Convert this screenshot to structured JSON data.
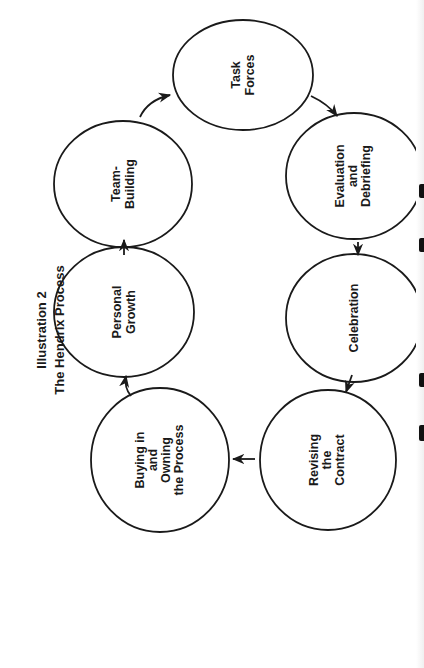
{
  "title": {
    "line1": "Illustration 2",
    "line2": "The Hendrix Process"
  },
  "colors": {
    "stroke": "#1a1a1a",
    "background": "#ffffff"
  },
  "nodes": [
    {
      "id": "task-forces",
      "lines": [
        "Task",
        "Forces"
      ]
    },
    {
      "id": "evaluation",
      "lines": [
        "Evaluation",
        "and",
        "Debriefing"
      ]
    },
    {
      "id": "celebration",
      "lines": [
        "Celebration"
      ]
    },
    {
      "id": "revising",
      "lines": [
        "Revising",
        "the",
        "Contract"
      ]
    },
    {
      "id": "buying-in",
      "lines": [
        "Buying in",
        "and",
        "Owning",
        "the Process"
      ]
    },
    {
      "id": "personal-growth",
      "lines": [
        "Personal",
        "Growth"
      ]
    },
    {
      "id": "team-building",
      "lines": [
        "Team-",
        "Building"
      ]
    }
  ],
  "edges": [
    {
      "from": "Task Forces",
      "to": "Evaluation and Debriefing"
    },
    {
      "from": "Evaluation and Debriefing",
      "to": "Celebration"
    },
    {
      "from": "Celebration",
      "to": "Revising the Contract"
    },
    {
      "from": "Revising the Contract",
      "to": "Buying in and Owning the Process"
    },
    {
      "from": "Buying in and Owning the Process",
      "to": "Personal Growth"
    },
    {
      "from": "Personal Growth",
      "to": "Team-Building"
    },
    {
      "from": "Team-Building",
      "to": "Task Forces"
    }
  ]
}
